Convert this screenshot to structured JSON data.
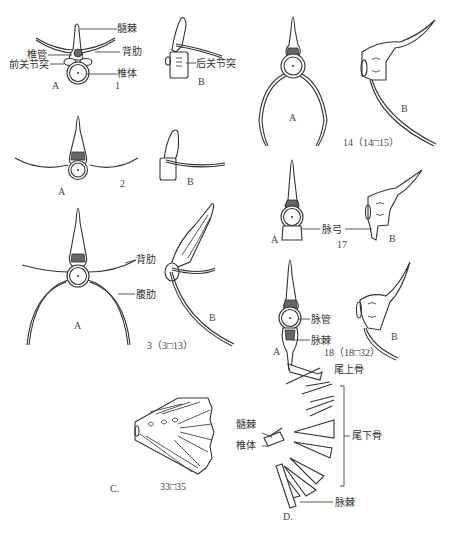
{
  "figure": {
    "type": "anatomical-diagram"
  },
  "labels": {
    "neural_spine": "髓棘",
    "neural_canal": "椎管",
    "prezygapophysis": "前关节突",
    "dorsal_rib": "背肋",
    "centrum": "椎体",
    "postzygapophysis": "后关节突",
    "dorsal_rib_3": "背肋",
    "ventral_rib": "腹肋",
    "haemal_arch": "脉弓",
    "haemal_canal": "脉管",
    "haemal_spine": "脉棘",
    "epural": "尾上骨",
    "hypural": "尾下骨",
    "neural_spine_d": "髓棘",
    "centrum_d": "椎体",
    "haemal_spine_d": "脉棘"
  },
  "views": {
    "a": "A",
    "b": "B",
    "c": "C.",
    "d": "D."
  },
  "captions": {
    "v1": "1",
    "v2": "2",
    "v3": "3（3□13）",
    "v14": "14（14□15）",
    "v17": "17",
    "v18": "18（18□32）",
    "v33": "33□35"
  }
}
